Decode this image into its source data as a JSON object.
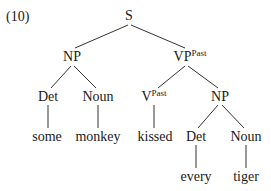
{
  "example_number": "(10)",
  "tree": {
    "nodes": [
      {
        "id": "S",
        "label": "S",
        "sup": "",
        "x": 129,
        "y": 16
      },
      {
        "id": "NP1",
        "label": "NP",
        "sup": "",
        "x": 72,
        "y": 57
      },
      {
        "id": "VP",
        "label": "VP",
        "sup": "Past",
        "x": 190,
        "y": 57
      },
      {
        "id": "Det1",
        "label": "Det",
        "sup": "",
        "x": 48,
        "y": 97
      },
      {
        "id": "Noun1",
        "label": "Noun",
        "sup": "",
        "x": 98,
        "y": 97
      },
      {
        "id": "V",
        "label": "V",
        "sup": "Past",
        "x": 154,
        "y": 97
      },
      {
        "id": "NP2",
        "label": "NP",
        "sup": "",
        "x": 220,
        "y": 97
      },
      {
        "id": "w_some",
        "label": "some",
        "sup": "",
        "x": 47,
        "y": 137
      },
      {
        "id": "w_monkey",
        "label": "monkey",
        "sup": "",
        "x": 98,
        "y": 137
      },
      {
        "id": "w_kissed",
        "label": "kissed",
        "sup": "",
        "x": 155,
        "y": 137
      },
      {
        "id": "Det2",
        "label": "Det",
        "sup": "",
        "x": 196,
        "y": 137
      },
      {
        "id": "Noun2",
        "label": "Noun",
        "sup": "",
        "x": 246,
        "y": 137
      },
      {
        "id": "w_every",
        "label": "every",
        "sup": "",
        "x": 196,
        "y": 177
      },
      {
        "id": "w_tiger",
        "label": "tiger",
        "sup": "",
        "x": 246,
        "y": 177
      }
    ],
    "edges": [
      {
        "from": [
          128,
          25
        ],
        "to": [
          75,
          48
        ]
      },
      {
        "from": [
          131,
          25
        ],
        "to": [
          185,
          48
        ]
      },
      {
        "from": [
          71,
          66
        ],
        "to": [
          51,
          88
        ]
      },
      {
        "from": [
          74,
          66
        ],
        "to": [
          96,
          88
        ]
      },
      {
        "from": [
          185,
          66
        ],
        "to": [
          158,
          88
        ]
      },
      {
        "from": [
          188,
          66
        ],
        "to": [
          218,
          88
        ]
      },
      {
        "from": [
          48,
          105
        ],
        "to": [
          48,
          128
        ]
      },
      {
        "from": [
          98,
          105
        ],
        "to": [
          98,
          128
        ]
      },
      {
        "from": [
          154,
          105
        ],
        "to": [
          154,
          128
        ]
      },
      {
        "from": [
          218,
          105
        ],
        "to": [
          198,
          128
        ]
      },
      {
        "from": [
          222,
          105
        ],
        "to": [
          244,
          128
        ]
      },
      {
        "from": [
          196,
          145
        ],
        "to": [
          196,
          168
        ]
      },
      {
        "from": [
          246,
          145
        ],
        "to": [
          246,
          168
        ]
      }
    ]
  }
}
